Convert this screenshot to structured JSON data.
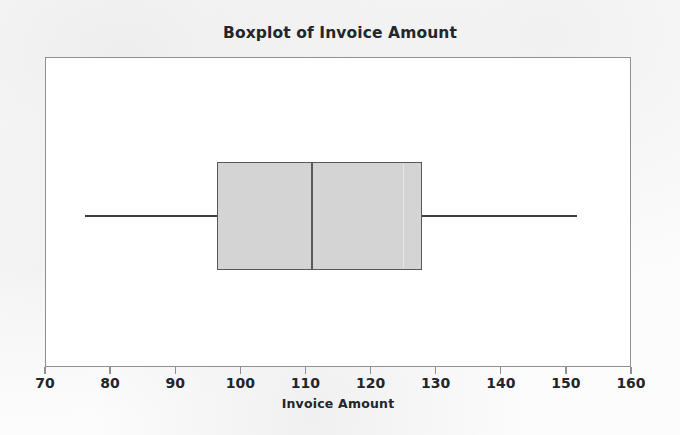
{
  "chart_data": {
    "type": "box",
    "title": "Boxplot of Invoice Amount",
    "xlabel": "Invoice Amount",
    "ylabel": "",
    "orientation": "horizontal",
    "xlim": [
      70,
      160
    ],
    "xticks": [
      70,
      80,
      90,
      100,
      110,
      120,
      130,
      140,
      150,
      160
    ],
    "xtick_labels": [
      "70",
      "80",
      "90",
      "100",
      "110",
      "120",
      "130",
      "140",
      "150",
      "160"
    ],
    "grid": false,
    "legend": null,
    "categories": [
      "Invoice Amount"
    ],
    "boxes": [
      {
        "name": "Invoice Amount",
        "min": 76.0,
        "q1": 96.3,
        "median": 110.7,
        "q3": 127.8,
        "max": 151.6,
        "outliers": [],
        "fill_color": "#d4d4d4",
        "line_color": "#55595e"
      }
    ],
    "colors": {
      "box_fill": "#d4d4d4",
      "box_border": "#55595e",
      "whisker": "#3b3f44",
      "median": "#55595e",
      "frame": "#8d9196",
      "plot_background": "#ffffff",
      "page_background": "#fcfcfc",
      "text": "#22262a"
    }
  }
}
